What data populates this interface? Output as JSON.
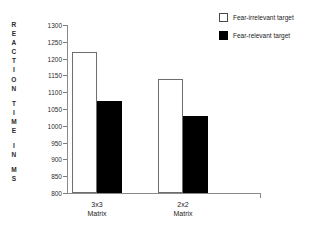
{
  "chart_data": {
    "type": "bar",
    "title": "",
    "xlabel": "",
    "ylabel": "REACTION TIME IN MS",
    "ylim": [
      800,
      1300
    ],
    "ytick_step": 50,
    "yticks": [
      1300,
      1250,
      1200,
      1150,
      1100,
      1050,
      1000,
      950,
      900,
      850,
      800
    ],
    "ytick_labels": [
      "1300",
      "1250",
      "1200",
      "1150",
      "1100",
      "1050",
      "1000",
      "950",
      "900",
      "850",
      "800"
    ],
    "categories": [
      "3x3 Matrix",
      "2x2 Matrix"
    ],
    "category_lines": [
      [
        "3x3",
        "Matrix"
      ],
      [
        "2x2",
        "Matrix"
      ]
    ],
    "grid": false,
    "legend_position": "top-right",
    "series": [
      {
        "name": "Fear-irrelevant target",
        "style": "open",
        "color": "#ffffff",
        "edge_color": "#6e6e6e",
        "values": [
          1220,
          1140
        ]
      },
      {
        "name": "Fear-relevant target",
        "style": "filled",
        "color": "#000000",
        "edge_color": "#000000",
        "values": [
          1075,
          1030
        ]
      }
    ]
  },
  "axis_title": {
    "text": "REACTION TIME IN MS",
    "words": [
      "REACTION",
      "TIME",
      "IN",
      "MS"
    ]
  },
  "legend": {
    "items": [
      {
        "label": "Fear-irrelevant target",
        "style": "open"
      },
      {
        "label": "Fear-relevant target",
        "style": "filled"
      }
    ]
  },
  "artifact": {
    "text": ""
  }
}
